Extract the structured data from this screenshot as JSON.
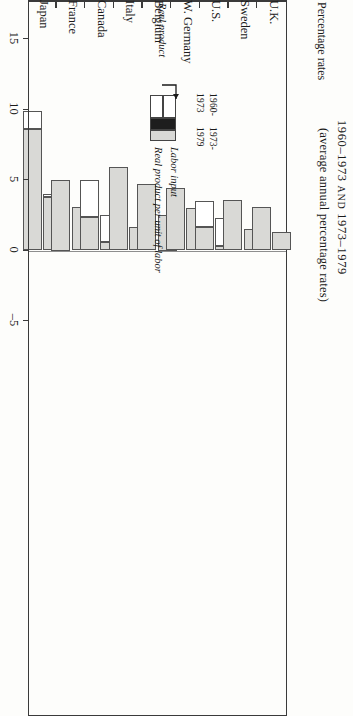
{
  "header": {
    "title_small_caps_prefix": "1960–1973",
    "title_and": "AND",
    "title_suffix": "1973–1979",
    "subtitle": "(average annual percentage rates)",
    "value_axis_caption": "Percentage rates"
  },
  "legend": {
    "col1_line1": "1960-",
    "col1_line2": "1973",
    "col2_line1": "1973-",
    "col2_line2": "1979",
    "series_total": "Real product",
    "series_white": "Labor input",
    "series_gray": "Real product per unit of labor"
  },
  "chart_data": {
    "type": "bar",
    "orientation": "horizontal-rotated",
    "title": "1960–1973 AND 1973–1979",
    "subtitle": "(average annual percentage rates)",
    "xlabel": "",
    "ylabel": "Percentage rates",
    "ylim": [
      -5,
      15
    ],
    "ticks": [
      15,
      10,
      5,
      0,
      -5
    ],
    "tick_labels": [
      "15",
      "10",
      "5",
      "0",
      "–5"
    ],
    "grid": false,
    "legend_position": "top-left-inset",
    "categories": [
      "Japan",
      "France",
      "Canada",
      "Italy",
      "Belgium",
      "W. Germany",
      "U.S.",
      "Sweden",
      "U.K."
    ],
    "periods": [
      "1960-1973",
      "1973-1979"
    ],
    "series": [
      {
        "name": "Real product per unit of labor",
        "color": "#d9d9d6",
        "values_1960_1973": [
          8.6,
          5.0,
          2.4,
          5.9,
          4.7,
          4.4,
          1.7,
          3.6,
          3.1
        ],
        "values_1973_1979": [
          3.8,
          3.1,
          0.6,
          1.7,
          2.5,
          3.0,
          0.3,
          1.5,
          1.3
        ]
      },
      {
        "name": "Labor input",
        "color": "#ffffff",
        "values_1960_1973": [
          1.3,
          -0.3,
          2.6,
          -1.3,
          -0.3,
          -0.2,
          1.8,
          -0.9,
          -0.9
        ],
        "values_1973_1979": [
          0.2,
          -0.8,
          1.9,
          -0.1,
          -1.1,
          -1.5,
          2.0,
          -1.0,
          -0.9
        ]
      },
      {
        "name": "Real product",
        "color": "total",
        "values_1960_1973": [
          9.9,
          4.7,
          5.0,
          4.6,
          4.4,
          4.2,
          3.5,
          2.7,
          2.2
        ],
        "values_1973_1979": [
          4.0,
          2.3,
          2.5,
          1.6,
          1.4,
          1.5,
          2.3,
          0.5,
          0.4
        ]
      }
    ]
  }
}
